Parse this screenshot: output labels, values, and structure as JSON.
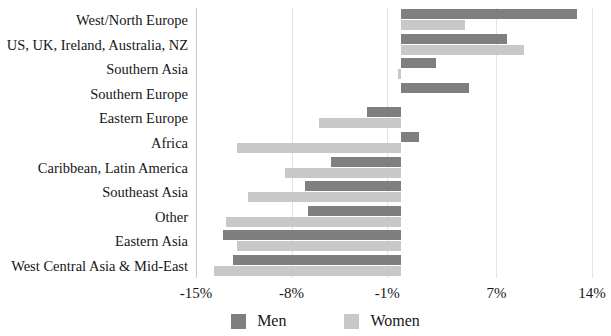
{
  "chart_data": {
    "type": "bar",
    "orientation": "horizontal",
    "title": "",
    "subtitle": "",
    "xlabel": "",
    "ylabel": "",
    "xlim": [
      -15,
      14
    ],
    "grid": true,
    "legend_position": "bottom",
    "xticks": [
      -15,
      -8,
      -1,
      7,
      14
    ],
    "xtick_labels": [
      "-15%",
      "-8%",
      "-1%",
      "7%",
      "14%"
    ],
    "categories": [
      "West/North Europe",
      "US, UK, Ireland, Australia, NZ",
      "Southern Asia",
      "Southern Europe",
      "Eastern Europe",
      "Africa",
      "Caribbean, Latin America",
      "Southeast Asia",
      "Other",
      "Eastern Asia",
      "West Central Asia & Mid-East"
    ],
    "series": [
      {
        "name": "Men",
        "color": "#7f7f7f",
        "values": [
          12.9,
          7.8,
          2.6,
          5.0,
          -2.5,
          1.3,
          -5.1,
          -7.0,
          -6.8,
          -13.0,
          -12.3
        ]
      },
      {
        "name": "Women",
        "color": "#c8c8c8",
        "values": [
          4.7,
          9.0,
          -0.2,
          0.0,
          -6.0,
          -12.0,
          -8.5,
          -11.2,
          -12.8,
          -12.0,
          -13.7
        ]
      }
    ]
  },
  "legend": {
    "items": [
      {
        "label": "Men",
        "color": "#7f7f7f"
      },
      {
        "label": "Women",
        "color": "#c8c8c8"
      }
    ]
  },
  "colors": {
    "men": "#7f7f7f",
    "women": "#c8c8c8",
    "gridline": "#e3e3e3",
    "text": "#161616",
    "background": "#ffffff"
  }
}
